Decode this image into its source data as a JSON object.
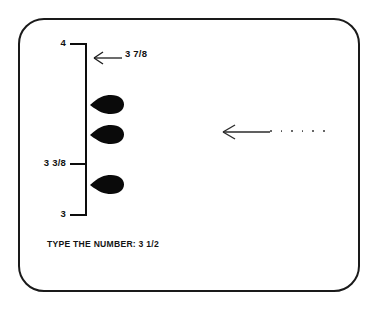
{
  "screen": {
    "bezel_color": "#1a1a1a",
    "background_color": "#ffffff"
  },
  "number_line": {
    "orientation": "vertical",
    "axis_color": "#0d0d0d",
    "ticks": [
      {
        "label": "4",
        "value": 4.0
      },
      {
        "label": "3 3/8",
        "value": 3.375
      },
      {
        "label": "3",
        "value": 3.0
      }
    ],
    "callout": {
      "label": "3 7/8",
      "value": 3.875,
      "arrow_icon": "arrow-left-icon"
    },
    "markers": [
      {
        "name": "teardrop-marker-1",
        "shape": "teardrop",
        "fill": "#0a0a0a"
      },
      {
        "name": "teardrop-marker-2",
        "shape": "teardrop",
        "fill": "#0a0a0a"
      },
      {
        "name": "teardrop-marker-3",
        "shape": "teardrop",
        "fill": "#0a0a0a"
      }
    ]
  },
  "cursor": {
    "icon": "arrow-left-icon",
    "color": "#2b2b2b",
    "trail_dot_count": 6,
    "trail_dot_color": "#4a4a4a"
  },
  "prompt": {
    "text": "TYPE THE NUMBER: 3 1/2",
    "instruction": "TYPE THE NUMBER:",
    "answer": "3 1/2"
  }
}
